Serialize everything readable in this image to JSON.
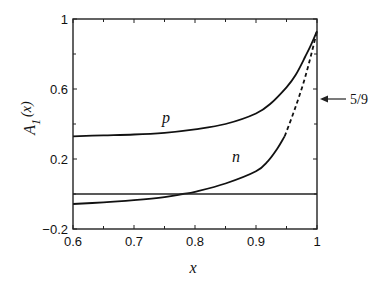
{
  "chart_data": {
    "type": "line",
    "title": "",
    "xlabel": "x",
    "ylabel": "A_1(x)",
    "ylabel_main": "A",
    "ylabel_sub": "1",
    "ylabel_arg": "(x)",
    "xlim": [
      0.6,
      1.0
    ],
    "ylim": [
      -0.2,
      1.0
    ],
    "x_ticks": [
      0.6,
      0.7,
      0.8,
      0.9,
      1.0
    ],
    "x_tick_labels": [
      "0.6",
      "0.7",
      "0.8",
      "0.9",
      "1"
    ],
    "x_minor_ticks": [
      0.65,
      0.75,
      0.85,
      0.95
    ],
    "y_ticks": [
      -0.2,
      0.2,
      0.6,
      1.0
    ],
    "y_tick_labels": [
      "-0.2",
      "0.2",
      "0.6",
      "1"
    ],
    "y_minor_ticks": [
      0.0,
      0.4,
      0.8
    ],
    "grid": false,
    "legend": null,
    "reference_line": {
      "y": 0.0,
      "style": "solid"
    },
    "series": [
      {
        "name": "p",
        "label_position": {
          "x": 0.765,
          "y": 0.42
        },
        "style": "solid",
        "x": [
          0.6,
          0.65,
          0.7,
          0.75,
          0.8,
          0.85,
          0.9,
          0.925,
          0.95,
          0.965,
          0.98,
          0.99,
          1.0
        ],
        "values": [
          0.33,
          0.335,
          0.34,
          0.35,
          0.37,
          0.4,
          0.46,
          0.52,
          0.61,
          0.68,
          0.78,
          0.85,
          0.93
        ]
      },
      {
        "name": "n",
        "label_position": {
          "x": 0.87,
          "y": 0.22
        },
        "segments": [
          {
            "style": "solid",
            "x": [
              0.6,
              0.65,
              0.7,
              0.75,
              0.78,
              0.8,
              0.85,
              0.9,
              0.92,
              0.935,
              0.947
            ],
            "values": [
              -0.057,
              -0.048,
              -0.035,
              -0.018,
              0.0,
              0.012,
              0.06,
              0.13,
              0.19,
              0.26,
              0.33
            ]
          },
          {
            "style": "dashed",
            "x": [
              0.947,
              0.96,
              0.97,
              0.98,
              0.99,
              1.0
            ],
            "values": [
              0.33,
              0.45,
              0.55,
              0.66,
              0.79,
              0.93
            ]
          }
        ]
      }
    ],
    "annotations": [
      {
        "text": "5/9",
        "points_to": {
          "x": 1.0,
          "y": 0.556
        },
        "arrow": "left"
      }
    ]
  },
  "labels": {
    "p": "p",
    "n": "n",
    "x_axis": "x",
    "five_ninths": "5/9"
  }
}
